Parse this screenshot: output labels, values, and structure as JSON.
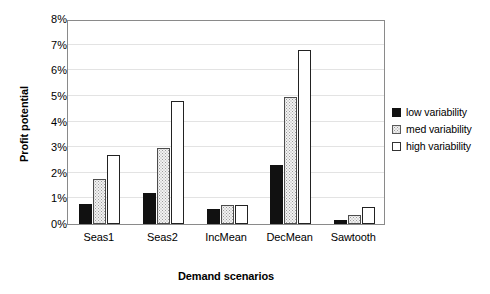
{
  "chart_data": {
    "type": "bar",
    "title": "",
    "xlabel": "Demand scenarios",
    "ylabel": "Profit potential",
    "categories": [
      "Seas1",
      "Seas2",
      "IncMean",
      "DecMean",
      "Sawtooth"
    ],
    "series": [
      {
        "name": "low variability",
        "values": [
          0.8,
          1.2,
          0.6,
          2.3,
          0.15
        ]
      },
      {
        "name": "med variability",
        "values": [
          1.75,
          2.95,
          0.75,
          4.95,
          0.35
        ]
      },
      {
        "name": "high variability",
        "values": [
          2.7,
          4.8,
          0.75,
          6.8,
          0.65
        ]
      }
    ],
    "ylim": [
      0,
      8
    ],
    "ytick_labels": [
      "0%",
      "1%",
      "2%",
      "3%",
      "4%",
      "5%",
      "6%",
      "7%",
      "8%"
    ],
    "ytick_values": [
      0,
      1,
      2,
      3,
      4,
      5,
      6,
      7,
      8
    ],
    "grid": true,
    "legend_position": "right",
    "colors": {
      "low_variability": "#111111",
      "med_variability": "#f2f2f2",
      "high_variability": "#ffffff",
      "bar_outline": "#1a1a1a",
      "gridline": "#e3e3e3",
      "frame": "#8a8a8a",
      "background": "#ffffff"
    }
  }
}
